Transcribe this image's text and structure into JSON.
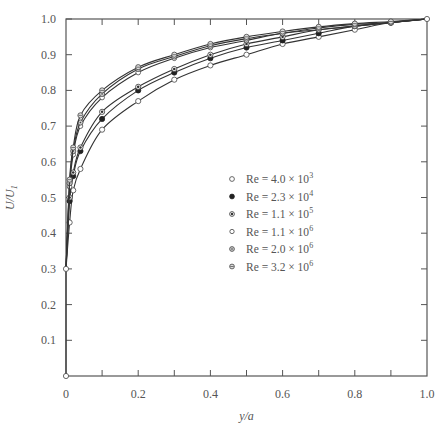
{
  "chart_data": {
    "type": "line",
    "title": "",
    "xlabel": "y/a",
    "ylabel": "U/U1",
    "xlim": [
      0,
      1.0
    ],
    "ylim": [
      0,
      1.0
    ],
    "grid": false,
    "legend_position": "center-right inside",
    "x_ticks": [
      "0",
      "0.2",
      "0.4",
      "0.6",
      "0.8",
      "1.0"
    ],
    "y_ticks": [
      "0.1",
      "0.2",
      "0.3",
      "0.4",
      "0.5",
      "0.6",
      "0.7",
      "0.8",
      "0.9",
      "1.0"
    ],
    "x_origin_label": "0",
    "x": [
      0.01,
      0.02,
      0.04,
      0.1,
      0.2,
      0.3,
      0.4,
      0.5,
      0.6,
      0.7,
      0.8,
      0.9,
      1.0
    ],
    "series": [
      {
        "name": "Re = 4.0 × 10^3",
        "label_base": "Re = 4.0 × 10",
        "exp": "3",
        "marker": "open",
        "values": [
          0.43,
          0.52,
          0.58,
          0.69,
          0.77,
          0.83,
          0.87,
          0.9,
          0.93,
          0.95,
          0.97,
          0.99,
          1.0
        ]
      },
      {
        "name": "Re = 2.3 × 10^4",
        "label_base": "Re = 2.3 × 10",
        "exp": "4",
        "marker": "filled",
        "values": [
          0.49,
          0.56,
          0.63,
          0.72,
          0.8,
          0.85,
          0.89,
          0.92,
          0.94,
          0.96,
          0.98,
          0.99,
          1.0
        ]
      },
      {
        "name": "Re = 1.1 × 10^5",
        "label_base": "Re = 1.1 × 10",
        "exp": "5",
        "marker": "half",
        "values": [
          0.5,
          0.57,
          0.64,
          0.74,
          0.81,
          0.86,
          0.9,
          0.93,
          0.95,
          0.97,
          0.98,
          0.99,
          1.0
        ]
      },
      {
        "name": "Re = 1.1 × 10^6",
        "label_base": "Re = 1.1 × 10",
        "exp": "6",
        "marker": "open-small",
        "values": [
          0.53,
          0.62,
          0.7,
          0.78,
          0.85,
          0.89,
          0.92,
          0.94,
          0.96,
          0.97,
          0.98,
          0.99,
          1.0
        ]
      },
      {
        "name": "Re = 2.0 × 10^6",
        "label_base": "Re = 2.0 × 10",
        "exp": "6",
        "marker": "dotted",
        "values": [
          0.54,
          0.63,
          0.71,
          0.79,
          0.86,
          0.895,
          0.925,
          0.945,
          0.96,
          0.975,
          0.985,
          0.99,
          1.0
        ]
      },
      {
        "name": "Re = 3.2 × 10^6",
        "label_base": "Re = 3.2 × 10",
        "exp": "6",
        "marker": "striped",
        "values": [
          0.55,
          0.64,
          0.73,
          0.8,
          0.865,
          0.9,
          0.93,
          0.95,
          0.965,
          0.978,
          0.987,
          0.993,
          1.0
        ]
      }
    ],
    "extra_points": [
      {
        "x": 0,
        "y": 0.3
      },
      {
        "x": 0,
        "y": 0
      }
    ]
  }
}
